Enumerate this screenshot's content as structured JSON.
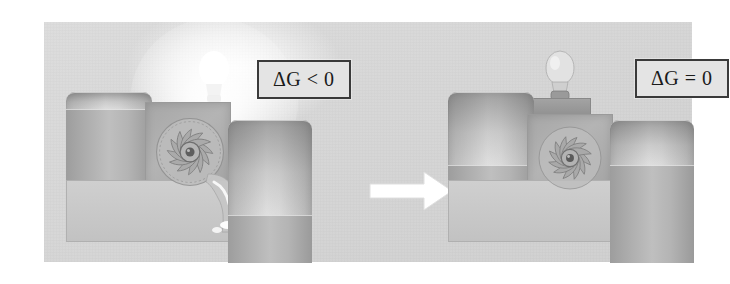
{
  "figure": {
    "background_color": "#ffffff",
    "panel_color": "#d6d6d6",
    "panel": {
      "x": 44,
      "y": 22,
      "width": 648,
      "height": 240
    }
  },
  "labels": {
    "left": "ΔG < 0",
    "right": "ΔG = 0",
    "border_color": "#3a3a3a",
    "text_color": "#1a1a1a"
  },
  "arrow": {
    "name": "transition-arrow",
    "direction": "right",
    "color": "#ffffff",
    "width": 86,
    "height": 42
  },
  "panels": [
    {
      "id": "spontaneous",
      "label": "ΔG < 0",
      "state": "non-equilibrium",
      "bulb": {
        "name": "light-bulb",
        "lit": true,
        "glow": true
      },
      "flow": {
        "flowing": true,
        "direction": "left-to-right"
      },
      "turbine": {
        "name": "turbine-impeller",
        "spinning": true,
        "blades": 12
      },
      "tanks": [
        {
          "name": "left-tank",
          "fill_fraction": 0.88,
          "position": "high"
        },
        {
          "name": "right-tank",
          "fill_fraction": 0.33,
          "position": "low"
        }
      ]
    },
    {
      "id": "equilibrium",
      "label": "ΔG = 0",
      "state": "equilibrium",
      "bulb": {
        "name": "light-bulb",
        "lit": false,
        "glow": false
      },
      "flow": {
        "flowing": false,
        "direction": "none"
      },
      "turbine": {
        "name": "turbine-impeller",
        "spinning": false,
        "blades": 12
      },
      "tanks": [
        {
          "name": "left-tank",
          "fill_fraction": 0.5,
          "position": "high"
        },
        {
          "name": "right-tank",
          "fill_fraction": 0.5,
          "position": "low"
        }
      ]
    }
  ],
  "colors": {
    "liquid": "#b0b0b0",
    "tank_body": "#dcdcdc",
    "housing": "#a8a8a8",
    "outline": "#9a9a9a"
  }
}
